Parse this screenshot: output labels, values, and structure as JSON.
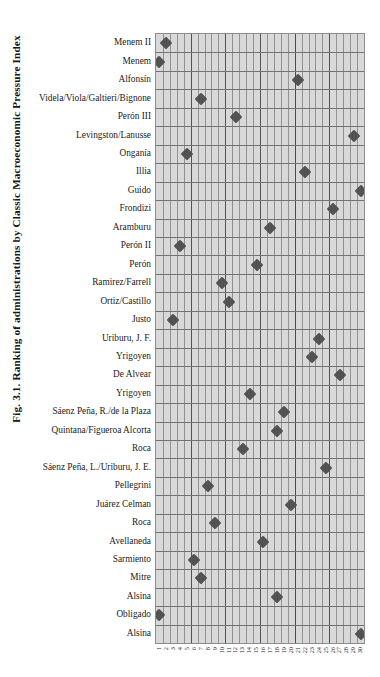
{
  "figure": {
    "caption": "Fig. 3.1.  Ranking of administrations by Classic Macroeconomic Pressure Index"
  },
  "chart_data": {
    "type": "scatter",
    "title": "Fig. 3.1.  Ranking of administrations by Classic Macroeconomic Pressure Index",
    "xlabel": "",
    "ylabel": "",
    "grid": true,
    "legend": "none",
    "marker": "diamond",
    "marker_color": "#4c4c4c",
    "plot_background": "#d9d9d9",
    "xlim": [
      0,
      30
    ],
    "x_tick_labels": [
      "1",
      "2",
      "3",
      "4",
      "5",
      "6",
      "7",
      "8",
      "9",
      "10",
      "11",
      "12",
      "13",
      "14",
      "15",
      "16",
      "17",
      "18",
      "19",
      "20",
      "21",
      "22",
      "23",
      "24",
      "25",
      "26",
      "27",
      "28",
      "29",
      "30"
    ],
    "categories": [
      "Menem II",
      "Menem",
      "Alfonsín",
      "Videla/Viola/Galtieri/Bignone",
      "Perón III",
      "Levingston/Lanusse",
      "Onganía",
      "Illia",
      "Guido",
      "Frondizi",
      "Aramburu",
      "Perón II",
      "Perón",
      "Ramirez/Farrell",
      "Ortiz/Castillo",
      "Justo",
      "Uriburu, J. F.",
      "Yrigoyen",
      "De Alvear",
      "Yrigoyen",
      "Sáenz Peña, R./de la Plaza",
      "Quintana/Figueroa Alcorta",
      "Roca",
      "Sáenz Peña, L./Uriburu, J. E.",
      "Pellegrini",
      "Juárez Celman",
      "Roca",
      "Avellaneda",
      "Sarmiento",
      "Mitre",
      "Alsina",
      "Obligado",
      "Alsina"
    ],
    "values": [
      2,
      1,
      21,
      7,
      12,
      29,
      5,
      22,
      30,
      26,
      17,
      4,
      15,
      10,
      11,
      3,
      24,
      23,
      27,
      14,
      19,
      18,
      13,
      25,
      8,
      20,
      9,
      16,
      6,
      7,
      18,
      1,
      30
    ]
  }
}
